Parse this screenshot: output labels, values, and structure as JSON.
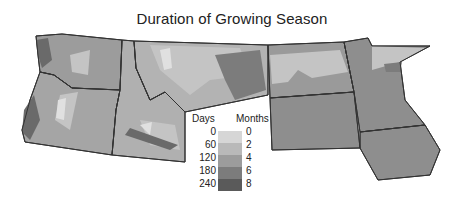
{
  "title": "Duration of Growing Season",
  "legend": {
    "days_header": "Days",
    "months_header": "Months",
    "days": [
      "0",
      "60",
      "120",
      "180",
      "240"
    ],
    "months": [
      "0",
      "2",
      "4",
      "6",
      "8"
    ],
    "colors": [
      "#d6d6d6",
      "#b9b9b9",
      "#9c9c9c",
      "#7c7c7c",
      "#5a5a5a"
    ]
  },
  "regions": [
    "Washington",
    "Oregon",
    "Idaho",
    "Montana",
    "Wyoming",
    "North Dakota",
    "South Dakota",
    "Minnesota",
    "Iowa"
  ]
}
